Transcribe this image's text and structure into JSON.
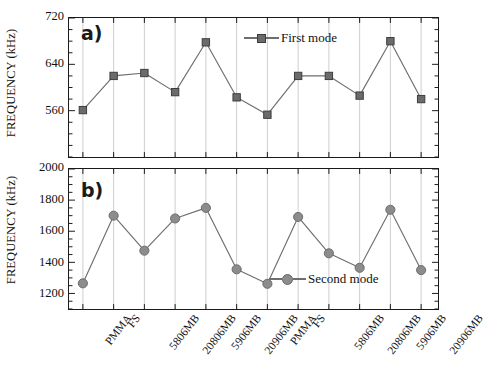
{
  "figure": {
    "ylabel": "FREQUENCY (kHz)",
    "categories": [
      "PMMA",
      "FS",
      "5806MB",
      "20806MB",
      "5906MB",
      "20906MB",
      "PMMA",
      "FS",
      "5806MB",
      "20806MB",
      "5906MB",
      "20906MB"
    ],
    "line_color": "#6e6e6e",
    "marker_square_color": "#6b6b6b",
    "marker_circle_color": "#8c8c8c",
    "gridline_color": "#c9c9c9",
    "axis_color": "#1a1a1a"
  },
  "panel_a": {
    "tag": "a)",
    "legend_label": "First mode",
    "yticks": [
      "720",
      "640",
      "560"
    ]
  },
  "panel_b": {
    "tag": "b)",
    "legend_label": "Second mode",
    "yticks": [
      "2000",
      "1800",
      "1600",
      "1400",
      "1200"
    ]
  },
  "chart_data": [
    {
      "type": "line",
      "panel": "a)",
      "title": "",
      "xlabel": "",
      "ylabel": "FREQUENCY (kHz)",
      "categories": [
        "PMMA",
        "FS",
        "5806MB",
        "20806MB",
        "5906MB",
        "20906MB",
        "PMMA",
        "FS",
        "5806MB",
        "20806MB",
        "5906MB",
        "20906MB"
      ],
      "series": [
        {
          "name": "First mode",
          "marker": "square",
          "values": [
            561,
            620,
            625,
            592,
            678,
            583,
            553,
            620,
            620,
            586,
            680,
            580
          ]
        }
      ],
      "ylim": [
        480,
        720
      ],
      "ytick_values": [
        560,
        640,
        720
      ],
      "yminor_step": 20,
      "grid": "vertical-only",
      "legend_position": "top-right"
    },
    {
      "type": "line",
      "panel": "b)",
      "title": "",
      "xlabel": "",
      "ylabel": "FREQUENCY (kHz)",
      "categories": [
        "PMMA",
        "FS",
        "5806MB",
        "20806MB",
        "5906MB",
        "20906MB",
        "PMMA",
        "FS",
        "5806MB",
        "20806MB",
        "5906MB",
        "20906MB"
      ],
      "series": [
        {
          "name": "Second mode",
          "marker": "circle",
          "values": [
            1265,
            1700,
            1475,
            1682,
            1750,
            1355,
            1262,
            1692,
            1458,
            1365,
            1738,
            1350
          ]
        }
      ],
      "ylim": [
        1100,
        2000
      ],
      "ytick_values": [
        1200,
        1400,
        1600,
        1800,
        2000
      ],
      "yminor_step": 50,
      "grid": "vertical-only",
      "legend_position": "bottom-right"
    }
  ]
}
